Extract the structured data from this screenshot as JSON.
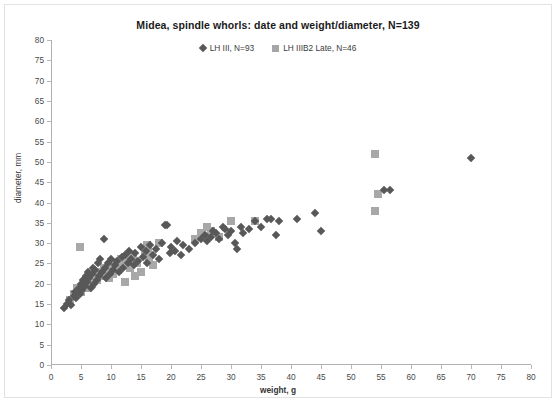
{
  "chart_data": {
    "type": "scatter",
    "title": "Midea, spindle whorls: date and weight/diameter, N=139",
    "xlabel": "weight, g",
    "ylabel": "diameter, mm",
    "xlim": [
      0,
      80
    ],
    "ylim": [
      0,
      80
    ],
    "xticks": [
      0,
      5,
      10,
      15,
      20,
      25,
      30,
      35,
      40,
      45,
      50,
      55,
      60,
      65,
      70,
      75,
      80
    ],
    "yticks": [
      0,
      5,
      10,
      15,
      20,
      25,
      30,
      35,
      40,
      45,
      50,
      55,
      60,
      65,
      70,
      75,
      80
    ],
    "grid": false,
    "legend_position": "top-center",
    "series": [
      {
        "name": "LH III, N=93",
        "marker": "diamond",
        "color": "#585858",
        "points": [
          [
            2.2,
            14.0
          ],
          [
            2.6,
            15.0
          ],
          [
            3.0,
            16.0
          ],
          [
            3.4,
            14.8
          ],
          [
            3.8,
            17.0
          ],
          [
            4.0,
            18.0
          ],
          [
            4.2,
            16.5
          ],
          [
            4.6,
            19.0
          ],
          [
            4.8,
            17.5
          ],
          [
            5.0,
            20.0
          ],
          [
            5.2,
            18.5
          ],
          [
            5.4,
            21.0
          ],
          [
            5.6,
            19.5
          ],
          [
            5.8,
            22.0
          ],
          [
            6.0,
            20.5
          ],
          [
            6.2,
            23.0
          ],
          [
            6.4,
            21.5
          ],
          [
            6.6,
            19.0
          ],
          [
            6.8,
            22.5
          ],
          [
            7.0,
            24.0
          ],
          [
            7.2,
            20.0
          ],
          [
            7.4,
            23.5
          ],
          [
            7.6,
            21.0
          ],
          [
            7.8,
            25.0
          ],
          [
            8.0,
            22.0
          ],
          [
            8.2,
            26.0
          ],
          [
            8.5,
            23.0
          ],
          [
            8.8,
            31.0
          ],
          [
            9.0,
            24.0
          ],
          [
            9.2,
            21.5
          ],
          [
            9.5,
            25.0
          ],
          [
            9.8,
            22.5
          ],
          [
            10.0,
            26.0
          ],
          [
            10.3,
            23.5
          ],
          [
            10.6,
            24.5
          ],
          [
            11.0,
            25.5
          ],
          [
            11.4,
            23.0
          ],
          [
            11.8,
            26.5
          ],
          [
            12.0,
            24.0
          ],
          [
            12.4,
            27.0
          ],
          [
            12.8,
            25.0
          ],
          [
            13.0,
            28.0
          ],
          [
            13.4,
            26.0
          ],
          [
            13.8,
            24.5
          ],
          [
            14.0,
            27.5
          ],
          [
            14.5,
            25.5
          ],
          [
            15.0,
            29.0
          ],
          [
            15.4,
            26.5
          ],
          [
            15.8,
            28.0
          ],
          [
            16.0,
            25.0
          ],
          [
            16.5,
            29.5
          ],
          [
            17.0,
            27.0
          ],
          [
            17.5,
            28.5
          ],
          [
            18.0,
            26.0
          ],
          [
            18.5,
            30.0
          ],
          [
            19.0,
            34.5
          ],
          [
            19.4,
            34.5
          ],
          [
            19.8,
            27.5
          ],
          [
            20.0,
            29.0
          ],
          [
            20.6,
            28.0
          ],
          [
            21.0,
            30.5
          ],
          [
            21.6,
            27.0
          ],
          [
            22.0,
            29.5
          ],
          [
            23.0,
            28.5
          ],
          [
            24.0,
            30.0
          ],
          [
            25.0,
            31.0
          ],
          [
            25.6,
            32.0
          ],
          [
            26.0,
            30.5
          ],
          [
            26.6,
            31.5
          ],
          [
            27.0,
            33.0
          ],
          [
            27.5,
            32.5
          ],
          [
            28.0,
            31.0
          ],
          [
            28.6,
            34.0
          ],
          [
            29.0,
            33.5
          ],
          [
            29.5,
            32.0
          ],
          [
            30.0,
            33.0
          ],
          [
            30.6,
            30.0
          ],
          [
            31.0,
            28.5
          ],
          [
            31.6,
            34.0
          ],
          [
            32.0,
            32.5
          ],
          [
            33.0,
            33.5
          ],
          [
            34.0,
            35.5
          ],
          [
            35.0,
            34.0
          ],
          [
            36.0,
            36.0
          ],
          [
            36.6,
            36.0
          ],
          [
            37.5,
            32.0
          ],
          [
            38.0,
            35.5
          ],
          [
            41.0,
            36.0
          ],
          [
            44.0,
            37.5
          ],
          [
            45.0,
            33.0
          ],
          [
            55.5,
            43.0
          ],
          [
            56.5,
            43.0
          ],
          [
            70.0,
            51.0
          ]
        ]
      },
      {
        "name": "LH IIIB2 Late, N=46",
        "marker": "square",
        "color": "#a8a8a8",
        "points": [
          [
            3.2,
            16.0
          ],
          [
            3.8,
            17.5
          ],
          [
            4.4,
            19.0
          ],
          [
            4.8,
            29.0
          ],
          [
            5.0,
            18.0
          ],
          [
            5.6,
            20.0
          ],
          [
            6.0,
            19.0
          ],
          [
            6.4,
            21.0
          ],
          [
            6.8,
            20.0
          ],
          [
            7.2,
            22.0
          ],
          [
            7.6,
            21.0
          ],
          [
            8.0,
            23.0
          ],
          [
            8.4,
            22.0
          ],
          [
            8.8,
            24.0
          ],
          [
            9.2,
            23.0
          ],
          [
            9.6,
            21.5
          ],
          [
            10.0,
            24.5
          ],
          [
            10.4,
            22.5
          ],
          [
            10.8,
            25.0
          ],
          [
            11.2,
            23.5
          ],
          [
            11.6,
            26.0
          ],
          [
            12.0,
            24.5
          ],
          [
            12.4,
            20.5
          ],
          [
            12.8,
            25.5
          ],
          [
            13.0,
            27.0
          ],
          [
            13.2,
            24.0
          ],
          [
            13.6,
            26.5
          ],
          [
            14.0,
            22.0
          ],
          [
            14.4,
            25.0
          ],
          [
            15.0,
            23.0
          ],
          [
            15.6,
            27.5
          ],
          [
            16.0,
            29.5
          ],
          [
            16.2,
            28.0
          ],
          [
            16.4,
            26.0
          ],
          [
            17.0,
            24.5
          ],
          [
            18.0,
            30.0
          ],
          [
            24.0,
            31.0
          ],
          [
            25.0,
            32.5
          ],
          [
            26.0,
            34.0
          ],
          [
            26.6,
            33.0
          ],
          [
            28.0,
            31.5
          ],
          [
            30.0,
            35.5
          ],
          [
            34.0,
            35.5
          ],
          [
            54.0,
            52.0
          ],
          [
            54.5,
            42.0
          ],
          [
            54.0,
            38.0
          ]
        ]
      }
    ]
  }
}
